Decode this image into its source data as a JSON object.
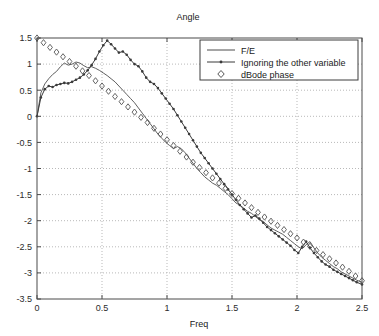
{
  "chart_data": {
    "type": "line",
    "title": "Angle",
    "xlabel": "Freq",
    "ylabel": "",
    "xlim": [
      0,
      2.5
    ],
    "ylim": [
      -3.5,
      1.5
    ],
    "grid": true,
    "grid_style": "dotted",
    "legend_position": "top-right",
    "xticks": [
      0,
      0.5,
      1,
      1.5,
      2,
      2.5
    ],
    "xticklabels": [
      "0",
      "0.5",
      "1",
      "1.5",
      "2",
      "2.5"
    ],
    "yticks": [
      -3.5,
      -3,
      -2.5,
      -2,
      -1.5,
      -1,
      -0.5,
      0,
      0.5,
      1,
      1.5
    ],
    "yticklabels": [
      "-3.5",
      "-3",
      "-2.5",
      "-2",
      "-1.5",
      "-1",
      "-0.5",
      "0",
      "0.5",
      "1",
      "1.5"
    ],
    "series": [
      {
        "name": "F/E",
        "style": "solid-thin",
        "marker": "none",
        "color": "#4d4d4d",
        "x": [
          0.0,
          0.03,
          0.06,
          0.09,
          0.12,
          0.15,
          0.18,
          0.21,
          0.24,
          0.27,
          0.3,
          0.33,
          0.36,
          0.39,
          0.42,
          0.45,
          0.48,
          0.51,
          0.54,
          0.57,
          0.6,
          0.63,
          0.66,
          0.69,
          0.72,
          0.75,
          0.78,
          0.81,
          0.84,
          0.87,
          0.9,
          0.93,
          0.96,
          0.99,
          1.02,
          1.05,
          1.08,
          1.11,
          1.14,
          1.17,
          1.2,
          1.23,
          1.26,
          1.29,
          1.32,
          1.35,
          1.38,
          1.41,
          1.44,
          1.47,
          1.5,
          1.53,
          1.56,
          1.59,
          1.62,
          1.65,
          1.68,
          1.71,
          1.74,
          1.77,
          1.8,
          1.83,
          1.86,
          1.89,
          1.92,
          1.95,
          1.98,
          2.01,
          2.04,
          2.07,
          2.1,
          2.13,
          2.16,
          2.19,
          2.22,
          2.25,
          2.28,
          2.31,
          2.34,
          2.37,
          2.4,
          2.43,
          2.46,
          2.5
        ],
        "y": [
          0.0,
          0.45,
          0.62,
          0.72,
          0.8,
          0.86,
          0.95,
          1.02,
          0.98,
          1.0,
          1.04,
          1.02,
          0.97,
          0.93,
          0.95,
          0.92,
          0.88,
          0.83,
          0.78,
          0.72,
          0.66,
          0.58,
          0.5,
          0.42,
          0.34,
          0.26,
          0.16,
          0.06,
          -0.04,
          -0.14,
          -0.24,
          -0.34,
          -0.42,
          -0.5,
          -0.56,
          -0.62,
          -0.58,
          -0.62,
          -0.7,
          -0.8,
          -0.9,
          -1.0,
          -1.08,
          -1.16,
          -1.22,
          -1.28,
          -1.32,
          -1.38,
          -1.44,
          -1.5,
          -1.58,
          -1.66,
          -1.7,
          -1.76,
          -1.82,
          -1.86,
          -1.92,
          -1.98,
          -2.02,
          -2.08,
          -2.14,
          -2.18,
          -2.22,
          -2.26,
          -2.32,
          -2.38,
          -2.44,
          -2.5,
          -2.54,
          -2.46,
          -2.4,
          -2.52,
          -2.62,
          -2.7,
          -2.76,
          -2.82,
          -2.88,
          -2.92,
          -2.98,
          -3.02,
          -3.06,
          -3.1,
          -3.14,
          -3.18
        ]
      },
      {
        "name": "Ignoring the other variable",
        "style": "solid-marker",
        "marker": "dot",
        "color": "#3a3a3a",
        "x": [
          0.0,
          0.03,
          0.06,
          0.09,
          0.12,
          0.15,
          0.18,
          0.21,
          0.24,
          0.27,
          0.3,
          0.33,
          0.36,
          0.39,
          0.42,
          0.45,
          0.48,
          0.51,
          0.54,
          0.57,
          0.6,
          0.63,
          0.66,
          0.69,
          0.72,
          0.75,
          0.78,
          0.81,
          0.84,
          0.87,
          0.9,
          0.93,
          0.96,
          0.99,
          1.02,
          1.05,
          1.08,
          1.11,
          1.14,
          1.17,
          1.2,
          1.23,
          1.26,
          1.29,
          1.32,
          1.35,
          1.38,
          1.41,
          1.44,
          1.47,
          1.5,
          1.53,
          1.56,
          1.59,
          1.62,
          1.65,
          1.68,
          1.71,
          1.74,
          1.77,
          1.8,
          1.83,
          1.86,
          1.89,
          1.92,
          1.95,
          1.98,
          2.01,
          2.04,
          2.07,
          2.1,
          2.13,
          2.16,
          2.19,
          2.22,
          2.25,
          2.28,
          2.31,
          2.34,
          2.37,
          2.4,
          2.43,
          2.46,
          2.5
        ],
        "y": [
          0.0,
          0.36,
          0.52,
          0.58,
          0.56,
          0.6,
          0.62,
          0.64,
          0.63,
          0.66,
          0.7,
          0.74,
          0.8,
          0.88,
          0.98,
          1.1,
          1.24,
          1.36,
          1.45,
          1.38,
          1.3,
          1.22,
          1.24,
          1.18,
          1.08,
          1.0,
          0.96,
          0.86,
          0.74,
          0.66,
          0.62,
          0.54,
          0.44,
          0.34,
          0.24,
          0.14,
          0.02,
          -0.1,
          -0.22,
          -0.34,
          -0.46,
          -0.58,
          -0.7,
          -0.8,
          -0.9,
          -1.0,
          -1.1,
          -1.2,
          -1.3,
          -1.4,
          -1.5,
          -1.6,
          -1.7,
          -1.78,
          -1.86,
          -1.94,
          -1.9,
          -1.96,
          -2.04,
          -2.12,
          -2.18,
          -2.24,
          -2.3,
          -2.36,
          -2.42,
          -2.48,
          -2.56,
          -2.62,
          -2.5,
          -2.4,
          -2.52,
          -2.62,
          -2.7,
          -2.78,
          -2.84,
          -2.88,
          -2.94,
          -2.98,
          -3.02,
          -3.06,
          -3.1,
          -3.14,
          -3.18,
          -3.22
        ]
      },
      {
        "name": "dBode phase",
        "style": "marker-only",
        "marker": "diamond",
        "color": "#555555",
        "x": [
          0.0,
          0.05,
          0.1,
          0.15,
          0.2,
          0.25,
          0.3,
          0.35,
          0.4,
          0.45,
          0.5,
          0.55,
          0.6,
          0.65,
          0.7,
          0.75,
          0.8,
          0.85,
          0.9,
          0.95,
          1.0,
          1.05,
          1.1,
          1.15,
          1.2,
          1.25,
          1.3,
          1.35,
          1.4,
          1.45,
          1.5,
          1.55,
          1.6,
          1.65,
          1.7,
          1.75,
          1.8,
          1.85,
          1.9,
          1.95,
          2.0,
          2.05,
          2.1,
          2.15,
          2.2,
          2.25,
          2.3,
          2.35,
          2.4,
          2.45,
          2.5
        ],
        "y": [
          1.5,
          1.41,
          1.32,
          1.23,
          1.14,
          1.05,
          0.96,
          0.87,
          0.78,
          0.68,
          0.58,
          0.48,
          0.38,
          0.28,
          0.18,
          0.08,
          -0.02,
          -0.12,
          -0.23,
          -0.34,
          -0.45,
          -0.56,
          -0.67,
          -0.78,
          -0.88,
          -0.98,
          -1.08,
          -1.18,
          -1.28,
          -1.38,
          -1.48,
          -1.57,
          -1.66,
          -1.75,
          -1.84,
          -1.93,
          -2.01,
          -2.09,
          -2.17,
          -2.25,
          -2.33,
          -2.41,
          -2.49,
          -2.57,
          -2.65,
          -2.73,
          -2.81,
          -2.89,
          -2.97,
          -3.06,
          -3.15
        ]
      }
    ]
  },
  "legend": {
    "items": [
      {
        "label": "F/E"
      },
      {
        "label": "Ignoring the other variable"
      },
      {
        "label": "dBode phase"
      }
    ]
  },
  "colors": {
    "axis": "#4a4a4a",
    "grid": "#b9b9b9",
    "text": "#1a1a1a",
    "background": "#ffffff"
  }
}
